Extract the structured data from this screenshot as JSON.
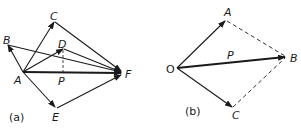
{
  "figure_a": {
    "caption": "(a)",
    "points": {
      "A": "A",
      "B": "B",
      "C": "C",
      "D": "D",
      "E": "E",
      "F": "F",
      "P": "P"
    }
  },
  "figure_b": {
    "caption": "(b)",
    "points": {
      "O": "O",
      "A": "A",
      "B": "B",
      "C": "C",
      "P": "P"
    }
  },
  "colors": {
    "ink": "#1a1a1a",
    "background": "#ffffff"
  }
}
